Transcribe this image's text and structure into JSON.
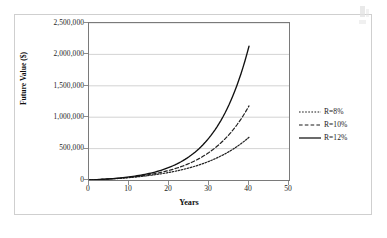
{
  "chart_data": {
    "type": "line",
    "title": "",
    "xlabel": "Years",
    "ylabel": "Future Value ($)",
    "xlim": [
      0,
      50
    ],
    "ylim": [
      0,
      2500000
    ],
    "x_ticks": [
      "0",
      "10",
      "20",
      "30",
      "40",
      "50"
    ],
    "x_tick_values": [
      0,
      10,
      20,
      30,
      40,
      50
    ],
    "y_ticks": [
      "0",
      "500,000",
      "1,000,000",
      "1,500,000",
      "2,000,000",
      "2,500,000"
    ],
    "y_tick_values": [
      0,
      500000,
      1000000,
      1500000,
      2000000,
      2500000
    ],
    "grid": "horizontal",
    "legend_position": "right",
    "x": [
      0,
      5,
      10,
      15,
      20,
      25,
      30,
      35,
      40
    ],
    "series": [
      {
        "name": "R=8%",
        "style": "dotted",
        "color": "#222222",
        "values": [
          0,
          29333,
          72433,
          135730,
          228810,
          365530,
          566420,
          861640,
          1295280
        ]
      },
      {
        "name": "R=10%",
        "style": "dashed",
        "color": "#222222",
        "values": [
          0,
          30526,
          79687,
          158860,
          286370,
          491730,
          822470,
          1355120,
          2212960
        ]
      },
      {
        "name": "R=12%",
        "style": "solid",
        "color": "#111111",
        "values": [
          0,
          31764,
          87744,
          186400,
          360260,
          666700,
          1206780,
          2158160,
          3835870
        ]
      }
    ],
    "series_endpoints_at_year_40": {
      "R=8%": 680000,
      "R=10%": 1180000,
      "R=12%": 2130000
    },
    "legend": [
      {
        "label": "R=8%",
        "style": "dotted"
      },
      {
        "label": "R=10%",
        "style": "dashed"
      },
      {
        "label": "R=12%",
        "style": "solid"
      }
    ]
  }
}
